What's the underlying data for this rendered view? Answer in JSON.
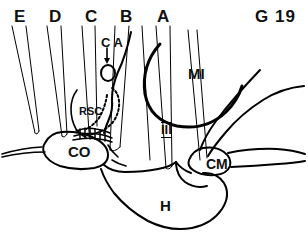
{
  "figure": {
    "id_label": "G 19",
    "type": "anatomical line diagram",
    "plane_labels": [
      {
        "text": "E",
        "x": 14,
        "y": 8
      },
      {
        "text": "D",
        "x": 49,
        "y": 8
      },
      {
        "text": "C",
        "x": 85,
        "y": 8
      },
      {
        "text": "B",
        "x": 120,
        "y": 8
      },
      {
        "text": "A",
        "x": 157,
        "y": 8
      }
    ],
    "structure_labels": [
      {
        "text": "C A",
        "x": 101,
        "y": 36
      },
      {
        "text": "RSC",
        "x": 79,
        "y": 106
      },
      {
        "text": "CO",
        "x": 68,
        "y": 144
      },
      {
        "text": "MI",
        "x": 188,
        "y": 66
      },
      {
        "text": "III",
        "x": 161,
        "y": 122
      },
      {
        "text": "CM",
        "x": 206,
        "y": 157
      },
      {
        "text": "H",
        "x": 160,
        "y": 198
      }
    ],
    "colors": {
      "stroke": "#000000",
      "background": "#ffffff"
    }
  }
}
